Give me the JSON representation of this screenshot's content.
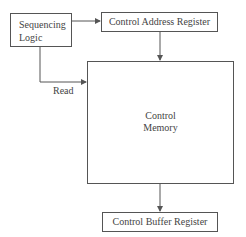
{
  "diagram": {
    "nodes": {
      "sequencing_logic": {
        "line1": "Sequencing",
        "line2": "Logic"
      },
      "control_address_register": {
        "label": "Control Address Register"
      },
      "control_memory": {
        "line1": "Control",
        "line2": "Memory"
      },
      "control_buffer_register": {
        "label": "Control Buffer Register"
      }
    },
    "edges": {
      "read_label": "Read"
    },
    "colors": {
      "line": "#555555",
      "text": "#444444",
      "background": "#ffffff"
    }
  }
}
